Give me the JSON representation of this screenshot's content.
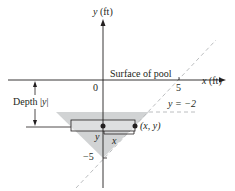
{
  "diagram": {
    "y_axis_label_var": "y",
    "y_axis_label_unit": " (ft)",
    "x_axis_label_var": "x",
    "x_axis_label_unit": " (ft)",
    "origin_label": "0",
    "x_tick_label": "5",
    "y_tick_label": "−5",
    "surface_label": "Surface of pool",
    "depth_label_prefix": "Depth |",
    "depth_label_var": "y",
    "depth_label_suffix": "|",
    "line_label": "y = −2",
    "point_label": "(x, y)",
    "rect_y_label": "y",
    "rect_x_label": "x",
    "colors": {
      "shade": "#d1d3d4",
      "ink": "#231f20",
      "dashed": "#bcbec0"
    }
  }
}
